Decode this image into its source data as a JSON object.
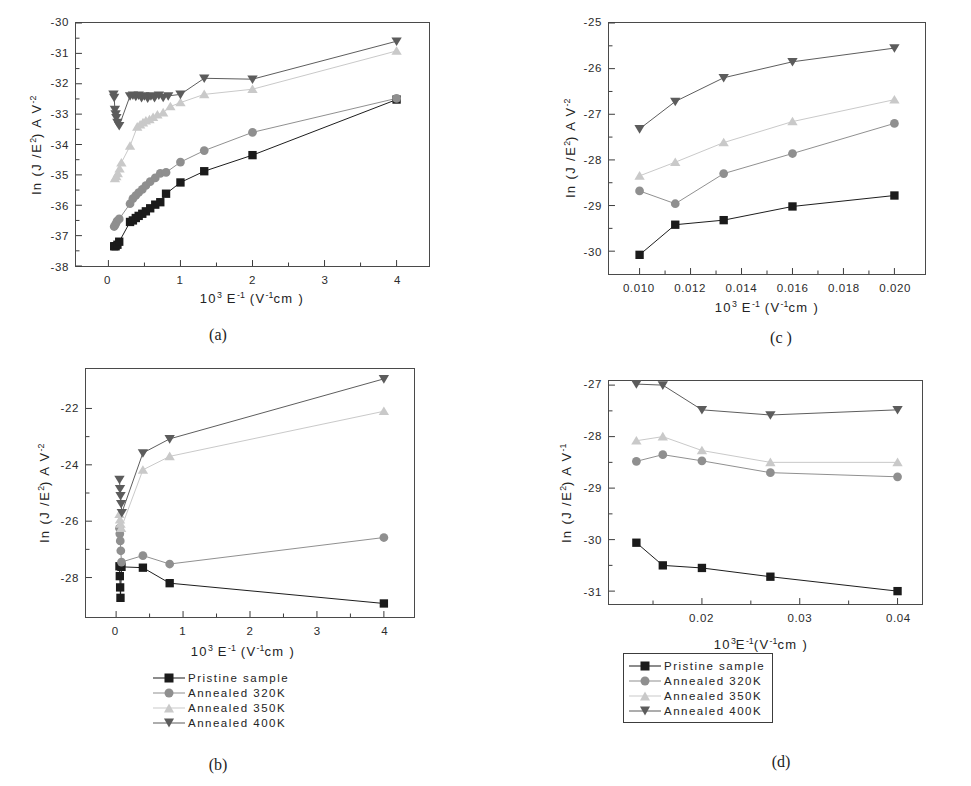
{
  "figure": {
    "series_styles": [
      {
        "key": "pristine",
        "marker": "square",
        "color": "#1b1b1b"
      },
      {
        "key": "ann320",
        "marker": "circle",
        "color": "#8f8f8f"
      },
      {
        "key": "ann350",
        "marker": "triangle-up",
        "color": "#c9c9c9"
      },
      {
        "key": "ann400",
        "marker": "triangle-down",
        "color": "#5c5c5c"
      }
    ],
    "legend_labels": [
      "Pristine sample",
      "Annealed 320K",
      "Annealed 350K",
      "Annealed 400K"
    ]
  },
  "chart_data": [
    {
      "id": "a",
      "caption": "(a)",
      "type": "line",
      "title": "",
      "xlabel_parts": {
        "pre": "10",
        "sup1": "3",
        "mid": " E",
        "sup2": "-1",
        "post": " (V",
        "sup3": "-1",
        "tail": "cm )"
      },
      "ylabel_parts": {
        "pre": "ln  (J /E",
        "sup1": "2",
        "mid": ")  A V",
        "sup2": "-2"
      },
      "xlim": [
        -0.45,
        4.45
      ],
      "ylim": [
        -38,
        -30
      ],
      "xticks": [
        0,
        1,
        2,
        3,
        4
      ],
      "xticklabels": [
        "0",
        "1",
        "2",
        "3",
        "4"
      ],
      "yticks": [
        -38,
        -37,
        -36,
        -35,
        -34,
        -33,
        -32,
        -31,
        -30
      ],
      "yticklabels": [
        "-38",
        "-37",
        "-36",
        "-35",
        "-34",
        "-33",
        "-32",
        "-31",
        "-30"
      ],
      "grid": false,
      "legend": false,
      "series": [
        {
          "name": "Pristine sample",
          "style": "pristine",
          "x": [
            0.08,
            0.1,
            0.125,
            0.15,
            0.3,
            0.34,
            0.38,
            0.42,
            0.47,
            0.52,
            0.58,
            0.65,
            0.72,
            0.8,
            1.0,
            1.33,
            2.0,
            4.0
          ],
          "y": [
            -37.35,
            -37.35,
            -37.3,
            -37.2,
            -36.55,
            -36.5,
            -36.42,
            -36.35,
            -36.28,
            -36.2,
            -36.1,
            -35.98,
            -35.9,
            -35.62,
            -35.25,
            -34.88,
            -34.35,
            -32.52
          ]
        },
        {
          "name": "Annealed 320K",
          "style": "ann320",
          "x": [
            0.08,
            0.1,
            0.12,
            0.15,
            0.3,
            0.34,
            0.38,
            0.42,
            0.47,
            0.52,
            0.58,
            0.65,
            0.72,
            0.8,
            1.0,
            1.33,
            2.0,
            4.0
          ],
          "y": [
            -36.7,
            -36.62,
            -36.52,
            -36.45,
            -35.95,
            -35.78,
            -35.68,
            -35.58,
            -35.48,
            -35.35,
            -35.22,
            -35.1,
            -34.95,
            -34.92,
            -34.58,
            -34.2,
            -33.6,
            -32.48
          ]
        },
        {
          "name": "Annealed 350K",
          "style": "ann350",
          "x": [
            0.09,
            0.11,
            0.13,
            0.155,
            0.18,
            0.3,
            0.4,
            0.44,
            0.48,
            0.52,
            0.57,
            0.62,
            0.68,
            0.76,
            0.86,
            1.0,
            1.33,
            2.0,
            4.0
          ],
          "y": [
            -35.12,
            -35.05,
            -34.95,
            -34.8,
            -34.6,
            -34.05,
            -33.42,
            -33.35,
            -33.28,
            -33.22,
            -33.18,
            -33.1,
            -33.02,
            -32.95,
            -32.75,
            -32.62,
            -32.35,
            -32.18,
            -30.92
          ]
        },
        {
          "name": "Annealed 400K",
          "style": "ann400",
          "x": [
            0.07,
            0.08,
            0.09,
            0.1,
            0.11,
            0.125,
            0.15,
            0.3,
            0.34,
            0.38,
            0.42,
            0.46,
            0.5,
            0.545,
            0.59,
            0.64,
            0.7,
            0.76,
            0.83,
            1.0,
            1.33,
            2.0,
            4.0
          ],
          "y": [
            -32.35,
            -32.45,
            -32.85,
            -33.0,
            -33.12,
            -33.28,
            -33.38,
            -32.4,
            -32.38,
            -32.42,
            -32.38,
            -32.46,
            -32.4,
            -32.48,
            -32.4,
            -32.46,
            -32.38,
            -32.45,
            -32.4,
            -32.35,
            -31.82,
            -31.85,
            -30.6
          ]
        }
      ]
    },
    {
      "id": "b",
      "caption": "(b)",
      "type": "line",
      "title": "",
      "xlabel_parts": {
        "pre": "10",
        "sup1": "3",
        "mid": " E",
        "sup2": "-1",
        "post": " (V",
        "sup3": "-1",
        "tail": "cm )"
      },
      "ylabel_parts": {
        "pre": "ln  (J /E",
        "sup1": "2",
        "mid": ")  A V",
        "sup2": "-2"
      },
      "xlim": [
        -0.45,
        4.45
      ],
      "ylim": [
        -29.4,
        -20.6
      ],
      "xticks": [
        0,
        1,
        2,
        3,
        4
      ],
      "xticklabels": [
        "0",
        "1",
        "2",
        "3",
        "4"
      ],
      "yticks": [
        -28,
        -26,
        -24,
        -22
      ],
      "yticklabels": [
        "-28",
        "-26",
        "-24",
        "-22"
      ],
      "grid": false,
      "legend": true,
      "legend_boxed": false,
      "series": [
        {
          "name": "Pristine sample",
          "style": "pristine",
          "x": [
            0.05,
            0.055,
            0.06,
            0.065,
            0.08,
            0.4,
            0.8,
            4.0
          ],
          "y": [
            -27.6,
            -27.95,
            -28.35,
            -28.72,
            -27.62,
            -27.65,
            -28.2,
            -28.92
          ]
        },
        {
          "name": "Annealed 320K",
          "style": "ann320",
          "x": [
            0.05,
            0.055,
            0.062,
            0.07,
            0.08,
            0.4,
            0.8,
            4.0
          ],
          "y": [
            -26.25,
            -26.45,
            -26.7,
            -27.05,
            -27.45,
            -27.22,
            -27.52,
            -26.58
          ]
        },
        {
          "name": "Annealed 350K",
          "style": "ann350",
          "x": [
            0.05,
            0.058,
            0.066,
            0.075,
            0.4,
            0.8,
            4.0
          ],
          "y": [
            -25.75,
            -25.95,
            -26.1,
            -26.25,
            -24.18,
            -23.7,
            -22.1
          ]
        },
        {
          "name": "Annealed 400K",
          "style": "ann400",
          "x": [
            0.05,
            0.058,
            0.066,
            0.075,
            0.085,
            0.4,
            0.8,
            4.0
          ],
          "y": [
            -24.52,
            -24.85,
            -25.1,
            -25.38,
            -25.7,
            -23.58,
            -23.08,
            -20.95
          ]
        }
      ]
    },
    {
      "id": "c",
      "caption": "(c )",
      "type": "line",
      "title": "",
      "xlabel_parts": {
        "pre": "10",
        "sup1": "3",
        "mid": " E",
        "sup2": "-1",
        "post": " (V",
        "sup3": "-1",
        "tail": "cm )"
      },
      "ylabel_parts": {
        "pre": "ln  (J /E",
        "sup1": "2",
        "mid": ")  A V",
        "sup2": "-2"
      },
      "xlim": [
        0.0088,
        0.0212
      ],
      "ylim": [
        -30.5,
        -25.0
      ],
      "xticks": [
        0.01,
        0.012,
        0.014,
        0.016,
        0.018,
        0.02
      ],
      "xticklabels": [
        "0.010",
        "0.012",
        "0.014",
        "0.016",
        "0.018",
        "0.020"
      ],
      "yticks": [
        -30,
        -29,
        -28,
        -27,
        -26,
        -25
      ],
      "yticklabels": [
        "-30",
        "-29",
        "-28",
        "-27",
        "-26",
        "-25"
      ],
      "grid": false,
      "legend": false,
      "series": [
        {
          "name": "Pristine sample",
          "style": "pristine",
          "x": [
            0.01,
            0.0114,
            0.0133,
            0.016,
            0.02
          ],
          "y": [
            -30.08,
            -29.42,
            -29.32,
            -29.02,
            -28.78
          ]
        },
        {
          "name": "Annealed 320K",
          "style": "ann320",
          "x": [
            0.01,
            0.0114,
            0.0133,
            0.016,
            0.02
          ],
          "y": [
            -28.68,
            -28.96,
            -28.3,
            -27.86,
            -27.2
          ]
        },
        {
          "name": "Annealed 350K",
          "style": "ann350",
          "x": [
            0.01,
            0.0114,
            0.0133,
            0.016,
            0.02
          ],
          "y": [
            -28.35,
            -28.05,
            -27.62,
            -27.16,
            -26.68
          ]
        },
        {
          "name": "Annealed 400K",
          "style": "ann400",
          "x": [
            0.01,
            0.0114,
            0.0133,
            0.016,
            0.02
          ],
          "y": [
            -27.32,
            -26.72,
            -26.2,
            -25.85,
            -25.55
          ]
        }
      ]
    },
    {
      "id": "d",
      "caption": "(d)",
      "type": "line",
      "title": "",
      "xlabel_parts": {
        "pre": "10",
        "sup1": "3",
        "mid": "E",
        "sup2": "-1",
        "post": "(V",
        "sup3": "-1",
        "tail": "cm )"
      },
      "ylabel_parts": {
        "pre": "ln (J /E",
        "sup1": "2",
        "mid": ") A V",
        "sup2": "-1"
      },
      "xlim": [
        0.0105,
        0.0425
      ],
      "ylim": [
        -31.25,
        -26.92
      ],
      "xticks": [
        0.01,
        0.02,
        0.03,
        0.04
      ],
      "xticklabels": [
        "0.01",
        "0.02",
        "0.03",
        "0.04"
      ],
      "yticks": [
        -31,
        -30,
        -29,
        -28,
        -27
      ],
      "yticklabels": [
        "-31",
        "-30",
        "-29",
        "-28",
        "-27"
      ],
      "grid": false,
      "legend": true,
      "legend_boxed": true,
      "series": [
        {
          "name": "Pristine sample",
          "style": "pristine",
          "x": [
            0.0133,
            0.016,
            0.02,
            0.027,
            0.04
          ],
          "y": [
            -30.06,
            -30.5,
            -30.55,
            -30.72,
            -31.0
          ]
        },
        {
          "name": "Annealed 320K",
          "style": "ann320",
          "x": [
            0.0133,
            0.016,
            0.02,
            0.027,
            0.04
          ],
          "y": [
            -28.48,
            -28.35,
            -28.47,
            -28.7,
            -28.78
          ]
        },
        {
          "name": "Annealed 350K",
          "style": "ann350",
          "x": [
            0.0133,
            0.016,
            0.02,
            0.027,
            0.04
          ],
          "y": [
            -28.08,
            -28.0,
            -28.27,
            -28.5,
            -28.5
          ]
        },
        {
          "name": "Annealed 400K",
          "style": "ann400",
          "x": [
            0.0133,
            0.016,
            0.02,
            0.027,
            0.04
          ],
          "y": [
            -26.98,
            -27.0,
            -27.48,
            -27.58,
            -27.48
          ]
        }
      ]
    }
  ]
}
